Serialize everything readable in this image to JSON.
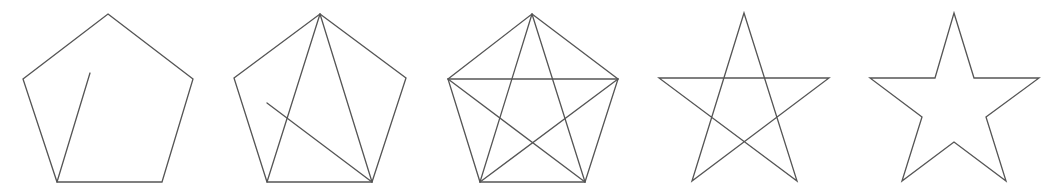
{
  "diagram": {
    "title": "",
    "stroke_color": "#555555",
    "background": "#ffffff",
    "figures": [
      {
        "id": "step-1",
        "description": "Pentagon outline with partial diagonal from bottom-left vertex toward top",
        "polygon": [
          [
            108,
            14
          ],
          [
            193,
            79
          ],
          [
            162,
            182
          ],
          [
            57,
            182
          ],
          [
            23,
            79
          ]
        ],
        "lines": [
          [
            [
              57,
              182
            ],
            [
              90,
              73
            ]
          ]
        ]
      },
      {
        "id": "step-2",
        "description": "Pentagon with two diagonals from top vertex and a partial diagonal from bottom-right vertex",
        "polygon": [
          [
            320,
            14
          ],
          [
            406,
            78
          ],
          [
            372,
            182
          ],
          [
            267,
            182
          ],
          [
            234,
            78
          ]
        ],
        "lines": [
          [
            [
              320,
              14
            ],
            [
              267,
              182
            ]
          ],
          [
            [
              320,
              14
            ],
            [
              372,
              182
            ]
          ],
          [
            [
              372,
              182
            ],
            [
              267,
              103
            ]
          ]
        ]
      },
      {
        "id": "step-3",
        "description": "Pentagon with all five diagonals forming an inscribed pentagram",
        "polygon": [
          [
            532,
            14
          ],
          [
            618,
            79
          ],
          [
            585,
            182
          ],
          [
            480,
            182
          ],
          [
            448,
            79
          ]
        ],
        "lines": [
          [
            [
              532,
              14
            ],
            [
              480,
              182
            ]
          ],
          [
            [
              532,
              14
            ],
            [
              585,
              182
            ]
          ],
          [
            [
              448,
              79
            ],
            [
              618,
              79
            ]
          ],
          [
            [
              448,
              79
            ],
            [
              585,
              182
            ]
          ],
          [
            [
              618,
              79
            ],
            [
              480,
              182
            ]
          ]
        ]
      },
      {
        "id": "step-4",
        "description": "Pentagram (star drawn with crossing lines)",
        "polygon": [
          [
            744,
            13
          ],
          [
            797,
            181
          ],
          [
            659,
            78
          ],
          [
            829,
            78
          ],
          [
            692,
            181
          ]
        ],
        "lines": []
      },
      {
        "id": "step-5",
        "description": "Five-pointed star outline",
        "polygon": [
          [
            954,
            13
          ],
          [
            974,
            78
          ],
          [
            1039,
            78
          ],
          [
            986,
            117
          ],
          [
            1006,
            181
          ],
          [
            954,
            142
          ],
          [
            902,
            181
          ],
          [
            922,
            117
          ],
          [
            870,
            78
          ],
          [
            935,
            78
          ]
        ],
        "lines": []
      }
    ]
  }
}
